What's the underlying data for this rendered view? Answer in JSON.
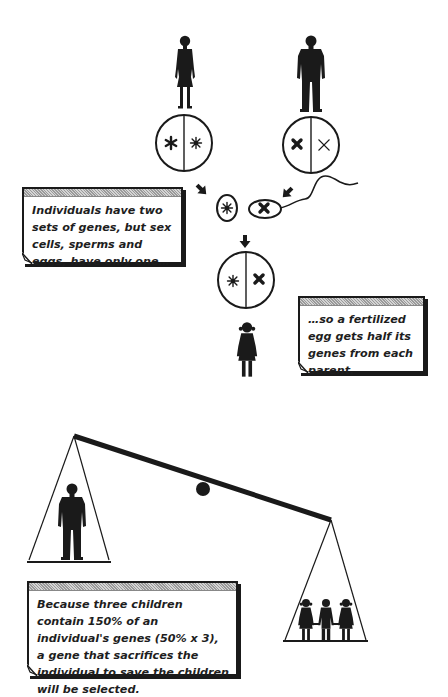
{
  "diagram": {
    "type": "kin-selection-illustration",
    "parents": {
      "mother": {
        "label": "female-figure",
        "genes": [
          "bold-asterisk",
          "star"
        ]
      },
      "father": {
        "label": "male-figure",
        "genes": [
          "bold-x",
          "thin-x"
        ]
      }
    },
    "gametes": {
      "egg": {
        "gene": "star"
      },
      "sperm": {
        "gene": "bold-x"
      }
    },
    "offspring": {
      "label": "girl-figure",
      "genes": [
        "star",
        "bold-x"
      ]
    },
    "scale": {
      "left_pan": "one adult individual",
      "right_pan": "three children holding hands",
      "heavier_side": "right"
    }
  },
  "callouts": [
    {
      "id": "box1",
      "text": "Individuals have two sets of genes, but sex cells, sperms and eggs, have only one…"
    },
    {
      "id": "box2",
      "text": "…so a fertilized egg gets half its genes from each parent."
    },
    {
      "id": "box3",
      "text": "Because three children contain 150% of an individual's genes (50% x 3), a gene that sacrifices the individual to save the children will be selected."
    }
  ],
  "colors": {
    "ink": "#1a1a1a",
    "paper": "#ffffff",
    "header_texture": "#b0b0b0"
  }
}
